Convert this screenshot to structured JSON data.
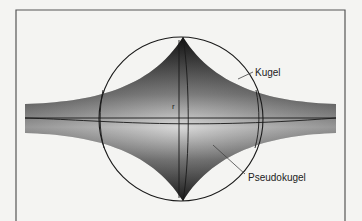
{
  "diagram": {
    "title": "",
    "labels": {
      "sphere": "Kugel",
      "pseudosphere": "Pseudokugel",
      "radius": "r"
    },
    "colors": {
      "background": "#f4f4f2",
      "frame": "#555555",
      "outline": "#222222",
      "shade_dark": "#1e1e1e",
      "shade_mid": "#5a5a5a",
      "shade_light": "#d8d8d8"
    }
  }
}
